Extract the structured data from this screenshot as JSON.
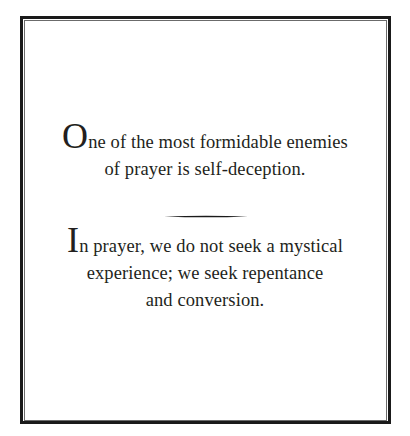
{
  "quote_card": {
    "paragraph_1": {
      "dropcap": "O",
      "lines": [
        "ne of the most formidable enemies",
        "of prayer is self-deception."
      ]
    },
    "divider": "tapered-rule",
    "paragraph_2": {
      "dropcap": "I",
      "lines": [
        "n prayer, we do not seek a mystical",
        "experience; we seek repentance",
        "and conversion."
      ]
    }
  },
  "colors": {
    "text": "#231f20",
    "border": "#1a1a1a",
    "background": "#ffffff"
  }
}
